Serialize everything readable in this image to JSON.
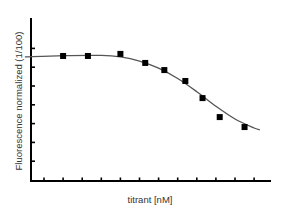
{
  "chart_data": {
    "type": "scatter",
    "title": "",
    "xlabel": "titrant [nM]",
    "ylabel": "Fluorescence normalized (1/100)",
    "x_ticks_count": 12,
    "y_ticks_count": 7,
    "x_tick_labels": [],
    "y_tick_labels": [],
    "xlim": [
      0,
      12.5
    ],
    "ylim": [
      0,
      8.6
    ],
    "grid": false,
    "legend": null,
    "series": [
      {
        "name": "measured",
        "marker": "square",
        "x": [
          2.0,
          3.3,
          5.0,
          6.3,
          7.3,
          8.4,
          9.3,
          10.2,
          11.5
        ],
        "y": [
          6.65,
          6.65,
          6.76,
          6.28,
          5.9,
          5.32,
          4.41,
          3.4,
          2.87
        ]
      },
      {
        "name": "fit",
        "style": "line",
        "description": "sigmoidal (dose-response) fit curve, decreasing",
        "x": [
          0.0,
          2.0,
          4.0,
          5.0,
          6.0,
          7.0,
          8.0,
          9.0,
          10.0,
          11.0,
          12.0,
          12.3
        ],
        "y": [
          6.6,
          6.67,
          6.68,
          6.6,
          6.38,
          6.0,
          5.45,
          4.75,
          3.98,
          3.3,
          2.82,
          2.72
        ]
      }
    ]
  },
  "colors": {
    "axis": "#000000",
    "marker": "#000000",
    "curve": "#555555",
    "text": "#333333"
  }
}
